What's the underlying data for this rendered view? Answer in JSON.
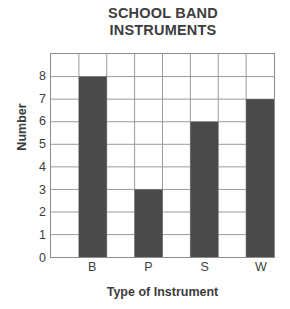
{
  "chart_data": {
    "type": "bar",
    "title": "SCHOOL BAND INSTRUMENTS",
    "title_lines": [
      "SCHOOL BAND",
      "INSTRUMENTS"
    ],
    "xlabel": "Type of Instrument",
    "ylabel": "Number",
    "categories": [
      "B",
      "P",
      "S",
      "W"
    ],
    "values": [
      8,
      3,
      6,
      7
    ],
    "series": [
      {
        "name": "Number",
        "values": [
          8,
          3,
          6,
          7
        ]
      }
    ],
    "ylim": [
      0,
      9
    ],
    "y_ticks": [
      0,
      1,
      2,
      3,
      4,
      5,
      6,
      7,
      8
    ],
    "y_tick_labels": [
      "0",
      "1",
      "2",
      "3",
      "4",
      "5",
      "6",
      "7",
      "8"
    ],
    "grid": true,
    "grid_columns": 8,
    "grid_rows": 9,
    "bar_columns": [
      2,
      4,
      6,
      8
    ],
    "legend": null,
    "legend_position": "none",
    "colors": {
      "bar": "#4a4a4a",
      "grid": "#9a9a9a",
      "axis_border": "#8d8d8d",
      "text": "#3d3d3d",
      "background": "#ffffff"
    }
  }
}
